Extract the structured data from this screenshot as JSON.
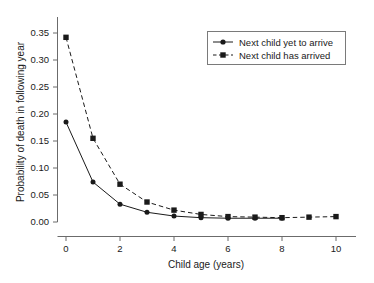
{
  "chart_data": {
    "type": "line",
    "title": "",
    "xlabel": "Child age (years)",
    "ylabel": "Probability of death in following year",
    "xlim": [
      -0.35,
      10.4
    ],
    "ylim": [
      0.0,
      0.355
    ],
    "grid": false,
    "legend_position": "top-right",
    "x_ticks": [
      0,
      2,
      4,
      6,
      8,
      10
    ],
    "x_tick_labels": [
      "0",
      "2",
      "4",
      "6",
      "8",
      "10"
    ],
    "y_ticks": [
      0.0,
      0.05,
      0.1,
      0.15,
      0.2,
      0.25,
      0.3,
      0.35
    ],
    "y_tick_labels": [
      "0.00",
      "0.05",
      "0.10",
      "0.15",
      "0.20",
      "0.25",
      "0.30",
      "0.35"
    ],
    "series": [
      {
        "name": "Next child yet to arrive",
        "marker": "circle",
        "linestyle": "solid",
        "color": "#1a1a1a",
        "x": [
          0,
          1,
          2,
          3,
          4,
          5,
          6,
          7,
          8
        ],
        "values": [
          0.185,
          0.074,
          0.033,
          0.018,
          0.011,
          0.008,
          0.007,
          0.007,
          0.007
        ]
      },
      {
        "name": "Next child has arrived",
        "marker": "square",
        "linestyle": "dashed",
        "color": "#1a1a1a",
        "x": [
          0,
          1,
          2,
          3,
          4,
          5,
          6,
          7,
          8,
          9,
          10
        ],
        "values": [
          0.342,
          0.155,
          0.07,
          0.037,
          0.022,
          0.014,
          0.01,
          0.009,
          0.008,
          0.009,
          0.01
        ]
      }
    ]
  },
  "legend": {
    "entries": [
      {
        "label": "Next child yet to arrive"
      },
      {
        "label": "Next child has arrived"
      }
    ]
  },
  "axes": {
    "x_title": "Child age (years)",
    "y_title": "Probability of death in following year"
  }
}
